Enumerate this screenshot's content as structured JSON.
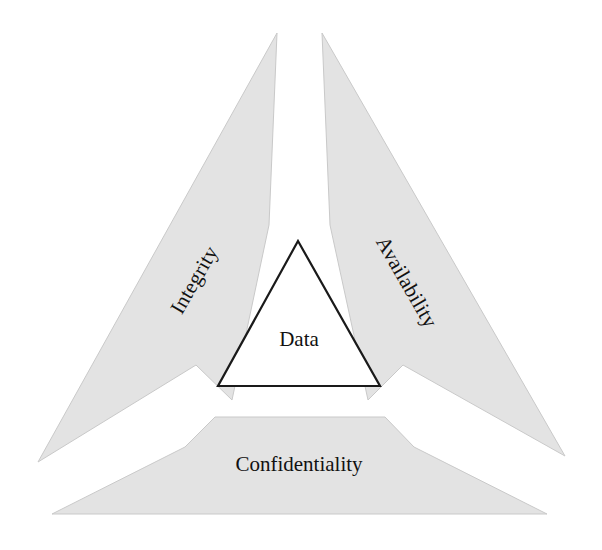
{
  "diagram": {
    "name": "cia-triad",
    "background_color": "#ffffff",
    "wedge_fill_color": "#e3e3e3",
    "wedge_stroke_color": "#c9c9c9",
    "text_color": "#111111",
    "inner_stroke_color": "#1a1a1a",
    "core": {
      "label": "Data",
      "shape": "triangle",
      "fill": "#ffffff"
    },
    "wedges": [
      {
        "id": "integrity",
        "label": "Integrity",
        "position": "upper-left",
        "rotation_deg": -60,
        "fill": "#e3e3e3"
      },
      {
        "id": "availability",
        "label": "Availability",
        "position": "upper-right",
        "rotation_deg": 60,
        "fill": "#e3e3e3"
      },
      {
        "id": "confidentiality",
        "label": "Confidentiality",
        "position": "bottom",
        "rotation_deg": 0,
        "fill": "#e3e3e3"
      }
    ]
  }
}
